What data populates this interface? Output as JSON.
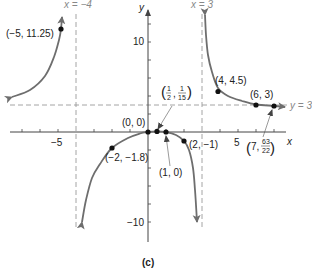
{
  "chart_data": {
    "type": "line",
    "title": "",
    "caption": "(c)",
    "xlabel": "x",
    "ylabel": "y",
    "function": "R(x) = 3x(x-1) / ((x+4)(x-3))",
    "x_ticks": [
      {
        "value": -5,
        "label": "−5"
      },
      {
        "value": 5,
        "label": "5"
      }
    ],
    "y_ticks": [
      {
        "value": 10,
        "label": "10"
      },
      {
        "value": -10,
        "label": "−10"
      }
    ],
    "xlim": [
      -7.5,
      7.8
    ],
    "ylim": [
      -12,
      13
    ],
    "grid": false,
    "asymptotes": [
      {
        "type": "vertical",
        "value": -4,
        "label": "x = −4"
      },
      {
        "type": "vertical",
        "value": 3,
        "label": "x = 3"
      },
      {
        "type": "horizontal",
        "value": 3,
        "label": "y = 3"
      }
    ],
    "points": [
      {
        "x": -5,
        "y": 11.25,
        "label": "(−5, 11.25)"
      },
      {
        "x": -2,
        "y": -1.8,
        "label": "(−2, −1.8)"
      },
      {
        "x": 0,
        "y": 0,
        "label": "(0, 0)"
      },
      {
        "x": 0.5,
        "y": 0.0667,
        "label": "(1/2, 1/15)"
      },
      {
        "x": 1,
        "y": 0,
        "label": "(1, 0)"
      },
      {
        "x": 2,
        "y": -1,
        "label": "(2, −1)"
      },
      {
        "x": 4,
        "y": 4.5,
        "label": "(4, 4.5)"
      },
      {
        "x": 6,
        "y": 3,
        "label": "(6, 3)"
      },
      {
        "x": 7,
        "y": 2.864,
        "label": "(7, 63/22)"
      }
    ],
    "branches": [
      {
        "name": "left",
        "px": [
          [
            12,
            97
          ],
          [
            30,
            90
          ],
          [
            45,
            76
          ],
          [
            54,
            57
          ],
          [
            59,
            40
          ],
          [
            61,
            29
          ],
          [
            62,
            17
          ]
        ]
      },
      {
        "name": "middle",
        "px": [
          [
            82,
            222
          ],
          [
            86,
            200
          ],
          [
            92,
            178
          ],
          [
            100,
            164
          ],
          [
            112,
            148
          ],
          [
            128,
            138
          ],
          [
            140,
            133.5
          ],
          [
            148,
            132
          ],
          [
            157,
            131.3
          ],
          [
            166,
            132
          ],
          [
            176,
            135
          ],
          [
            184,
            141
          ],
          [
            189,
            150
          ],
          [
            193,
            168
          ],
          [
            195,
            190
          ],
          [
            197,
            222
          ]
        ]
      },
      {
        "name": "right",
        "px": [
          [
            205,
            15
          ],
          [
            206,
            35
          ],
          [
            208,
            55
          ],
          [
            212,
            72
          ],
          [
            218,
            88
          ],
          [
            228,
            96
          ],
          [
            242,
            101
          ],
          [
            256,
            104.5
          ],
          [
            274,
            106
          ],
          [
            285,
            107
          ]
        ]
      }
    ]
  },
  "labels": {
    "y_axis": "y",
    "x_axis": "x",
    "x_neg4": "x = −4",
    "x_3": "x = 3",
    "y_3": "y = 3",
    "tick_neg5": "−5",
    "tick_5": "5",
    "tick_10": "10",
    "tick_neg10": "−10",
    "pt_neg5": "(−5, 11.25)",
    "pt_origin": "(0, 0)",
    "pt_half_open": "(",
    "pt_half_close": ")",
    "pt_half_n1": "1",
    "pt_half_d1": "2",
    "pt_half_n2": "1",
    "pt_half_d2": "15",
    "pt_half_comma": ",",
    "pt_one": "(1, 0)",
    "pt_two": "(2, −1)",
    "pt_neg2": "(−2, −1.8)",
    "pt_four": "(4, 4.5)",
    "pt_six": "(6, 3)",
    "pt_seven_pre": "(7,",
    "pt_seven_n": "63",
    "pt_seven_d": "22",
    "pt_seven_close": ")",
    "caption": "(c)"
  }
}
